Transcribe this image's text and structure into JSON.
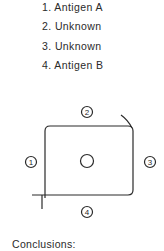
{
  "wells": [
    {
      "number": "1.",
      "label": "Antigen A"
    },
    {
      "number": "2.",
      "label": "Unknown"
    },
    {
      "number": "3.",
      "label": "Unknown"
    },
    {
      "number": "4.",
      "label": "Antigen B"
    }
  ],
  "diagram": {
    "well_labels": {
      "top": "2",
      "left": "1",
      "right": "3",
      "bottom": "4"
    },
    "center_well": "antibody well",
    "stroke_color": "#2a2a2a"
  },
  "conclusions_label": "Conclusions:"
}
